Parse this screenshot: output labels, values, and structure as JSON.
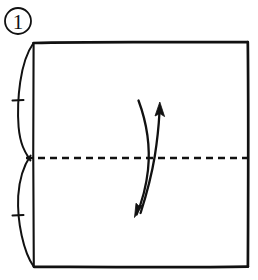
{
  "figure": {
    "kind": "origami-fold-diagram",
    "step_label": "1",
    "caption": "",
    "background_color": "#ffffff",
    "ink_color": "#111111"
  },
  "step_badge": {
    "name": "step-number-badge",
    "label": "1",
    "shape": "circle",
    "center_x": 18,
    "center_y": 21,
    "radius": 13
  },
  "paper": {
    "name": "square-paper-outline",
    "shape": "square",
    "left": 33,
    "top": 42,
    "right": 248,
    "bottom": 267,
    "width": 215,
    "height": 225,
    "stroke_color": "#111111",
    "stroke_width": 2.6,
    "fill": "#ffffff"
  },
  "crease_line": {
    "name": "horizontal-valley-crease-line",
    "style": "dashed",
    "orientation": "horizontal",
    "y": 158,
    "x_start": 26,
    "x_end": 250,
    "dash_length": 7,
    "dash_gap": 5,
    "stroke_color": "#111111",
    "stroke_width": 2.4
  },
  "edge_brackets": {
    "name": "left-edge-equal-length-brackets",
    "description": "two outward bowed arcs on the left edge marking equal halves",
    "upper_arc": {
      "name": "upper-half-bracket-arc",
      "start_x": 33,
      "start_y": 42,
      "end_x": 30,
      "end_y": 160,
      "bulge_x": 17,
      "tick_y": 100
    },
    "lower_arc": {
      "name": "lower-half-bracket-arc",
      "start_x": 30,
      "start_y": 156,
      "end_x": 33,
      "end_y": 267,
      "bulge_x": 17,
      "tick_y": 215
    },
    "tick_length": 11,
    "stroke_color": "#111111",
    "stroke_width": 1.9
  },
  "fold_arrow": {
    "name": "valley-fold-double-arrow",
    "description": "curved double headed arrow crossing the crease line indicating fold in half",
    "top_arrow_head": {
      "name": "arrow-head-up",
      "tip_x": 160,
      "tip_y": 103,
      "direction": "up"
    },
    "bottom_arrow_head": {
      "name": "arrow-head-down",
      "tip_x": 136,
      "tip_y": 215,
      "direction": "down"
    },
    "stroke_color": "#111111",
    "stroke_width": 2.2
  }
}
